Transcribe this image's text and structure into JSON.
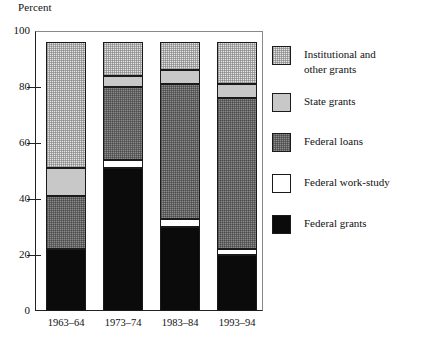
{
  "chart_data": {
    "type": "bar",
    "subtype": "stacked-vertical-100",
    "title": "",
    "xlabel": "",
    "ylabel": "Percent",
    "ylim": [
      0,
      100
    ],
    "yticks": [
      0,
      20,
      40,
      60,
      80,
      100
    ],
    "ytick_labels": [
      "0",
      "20",
      "40",
      "60",
      "80",
      "100"
    ],
    "grid": false,
    "legend_position": "right",
    "categories": [
      "1963–64",
      "1973–74",
      "1983–84",
      "1993–94"
    ],
    "series": [
      {
        "name": "Federal grants",
        "values": [
          22,
          51,
          30,
          20
        ]
      },
      {
        "name": "Federal work-study",
        "values": [
          0,
          3,
          3,
          2
        ]
      },
      {
        "name": "Federal loans",
        "values": [
          19,
          26,
          48,
          54
        ]
      },
      {
        "name": "State grants",
        "values": [
          10,
          4,
          5,
          5
        ]
      },
      {
        "name": "Institutional and other grants",
        "values": [
          45,
          12,
          10,
          15
        ]
      }
    ],
    "series_totals": [
      96,
      96,
      96,
      96
    ]
  },
  "axis": {
    "y_title": "Percent",
    "y_ticks": [
      {
        "label": "100",
        "value": 100
      },
      {
        "label": "80",
        "value": 80
      },
      {
        "label": "60",
        "value": 60
      },
      {
        "label": "40",
        "value": 40
      },
      {
        "label": "20",
        "value": 20
      },
      {
        "label": "0",
        "value": 0
      }
    ],
    "x_labels": [
      "1963–64",
      "1973–74",
      "1983–84",
      "1993–94"
    ]
  },
  "legend": {
    "items": [
      {
        "label": "Institutional and\nother grants",
        "swatch": "institutional-swatch",
        "color": "#e3e3e3"
      },
      {
        "label": "State grants",
        "swatch": "state-swatch",
        "color": "#c8c8c8"
      },
      {
        "label": "Federal loans",
        "swatch": "loans-swatch",
        "color": "#8c8c8c"
      },
      {
        "label": "Federal work-study",
        "swatch": "workstudy-swatch",
        "color": "#ffffff"
      },
      {
        "label": "Federal grants",
        "swatch": "grants-swatch",
        "color": "#0b0b0b"
      }
    ]
  }
}
